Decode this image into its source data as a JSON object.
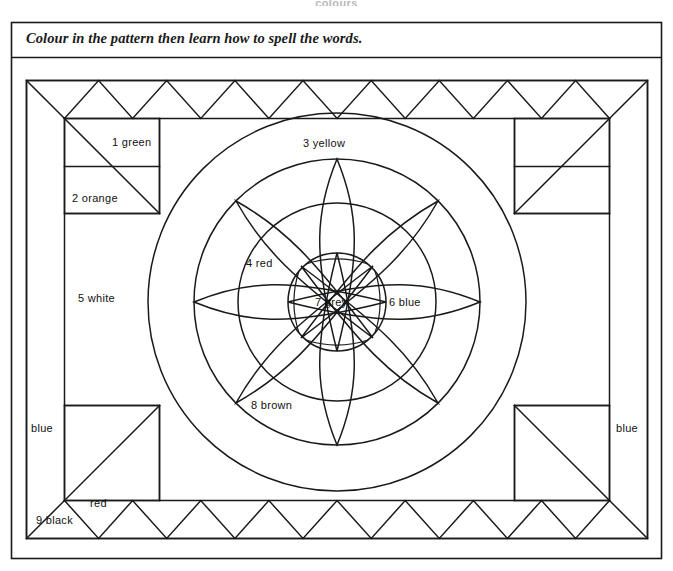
{
  "page": {
    "header_title": "colours",
    "instruction": "Colour in the pattern then learn how to spell the words."
  },
  "pattern": {
    "labels": [
      {
        "id": 1,
        "number": "1",
        "word": "green",
        "text": "1  green",
        "x": 112,
        "y": 146,
        "anchor": "start"
      },
      {
        "id": 2,
        "number": "2",
        "word": "orange",
        "text": "2  orange",
        "x": 72,
        "y": 202,
        "anchor": "start"
      },
      {
        "id": 3,
        "number": "3",
        "word": "yellow",
        "text": "3  yellow",
        "x": 303,
        "y": 147,
        "anchor": "start"
      },
      {
        "id": 4,
        "number": "4",
        "word": "red",
        "text": "4  red",
        "x": 246,
        "y": 267,
        "anchor": "start"
      },
      {
        "id": 5,
        "number": "5",
        "word": "white",
        "text": "5  white",
        "x": 78,
        "y": 302,
        "anchor": "start"
      },
      {
        "id": 6,
        "number": "6",
        "word": "blue",
        "text": "6  blue",
        "x": 389,
        "y": 306,
        "anchor": "start"
      },
      {
        "id": 7,
        "number": "7",
        "word": "grey",
        "text": "7  grey",
        "x": 315,
        "y": 306,
        "anchor": "start"
      },
      {
        "id": 8,
        "number": "8",
        "word": "brown",
        "text": "8  brown",
        "x": 251,
        "y": 409,
        "anchor": "start"
      },
      {
        "id": 9,
        "number": "9",
        "word": "black",
        "text": "9  black",
        "x": 36,
        "y": 524,
        "anchor": "start"
      }
    ],
    "unnumbered_labels": [
      {
        "id": "left-blue",
        "text": "blue",
        "x": 31,
        "y": 432,
        "anchor": "start"
      },
      {
        "id": "right-blue",
        "text": "blue",
        "x": 616,
        "y": 432,
        "anchor": "start"
      },
      {
        "id": "bottom-red",
        "text": "red",
        "x": 90,
        "y": 507,
        "anchor": "start"
      }
    ],
    "colour_words": [
      "green",
      "orange",
      "yellow",
      "red",
      "white",
      "blue",
      "grey",
      "brown",
      "black"
    ],
    "geometry": {
      "center_x": 337,
      "center_y": 302,
      "ring_radii": [
        189,
        143,
        99,
        49
      ],
      "petal_count": 8,
      "top_zigzag_peaks": 8,
      "bottom_zigzag_peaks": 8,
      "side_zigzag_peaks": 0
    },
    "colors": {
      "ink": "#1a1a1a",
      "paper": "#ffffff",
      "header_grey": "#b9b9b9"
    }
  }
}
